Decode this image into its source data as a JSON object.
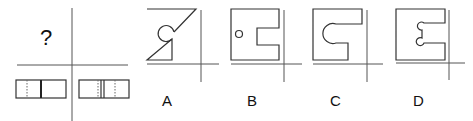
{
  "puzzle": {
    "question_mark": "?",
    "views": {
      "front_view": "unknown",
      "side_view": "rectangle with dotted line and solid divider",
      "top_view": "rectangle with dotted lines and double solid divider"
    },
    "options": [
      {
        "label": "A",
        "description": "square with diagonal cut and circular hole at notch"
      },
      {
        "label": "B",
        "description": "square with rectangular notch and small circle hole"
      },
      {
        "label": "C",
        "description": "square with slot ending in large semicircle"
      },
      {
        "label": "D",
        "description": "square with slot with two small semicircular corners"
      }
    ]
  },
  "colors": {
    "line": "#333333",
    "background": "#ffffff"
  }
}
